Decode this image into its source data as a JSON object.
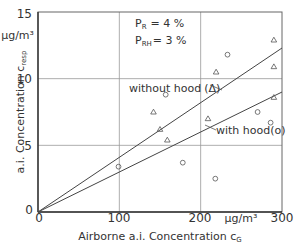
{
  "chart_data": {
    "type": "scatter",
    "title": "",
    "xlabel": "Airborne a.i. Concentration c_G",
    "xlabel_main": "Airborne a.i. Concentration c",
    "xlabel_sub": "G",
    "ylabel_main": "a.i. Concentration c",
    "ylabel_sub": "resp",
    "x_unit": "µg/m³",
    "y_unit": "µg/m³",
    "xlim": [
      0,
      300
    ],
    "ylim": [
      0,
      15
    ],
    "xticks": [
      "0",
      "100",
      "200",
      "300"
    ],
    "yticks": [
      "0",
      "5",
      "10",
      "15"
    ],
    "grid": true,
    "annotations": [
      {
        "label": "P",
        "sub": "R",
        "value": "= 4 %"
      },
      {
        "label": "P",
        "sub": "RH",
        "value": "= 3 %"
      }
    ],
    "series": [
      {
        "name": "without hood (Δ)",
        "label": "without hood",
        "marker": "triangle",
        "marker_label": "(Δ)",
        "points": [
          [
            142,
            7.5
          ],
          [
            150,
            6.2
          ],
          [
            159,
            5.4
          ],
          [
            209,
            7.0
          ],
          [
            219,
            10.5
          ],
          [
            290,
            12.9
          ],
          [
            290,
            10.9
          ],
          [
            290,
            8.6
          ]
        ],
        "fit_line": {
          "from": [
            0,
            0
          ],
          "to": [
            300,
            12.3
          ]
        }
      },
      {
        "name": "with hood (o)",
        "label": "with hood",
        "marker": "circle",
        "marker_label": "(o)",
        "points": [
          [
            99,
            3.4
          ],
          [
            157,
            8.8
          ],
          [
            178,
            3.7
          ],
          [
            218,
            2.5
          ],
          [
            233,
            11.8
          ],
          [
            270,
            7.5
          ],
          [
            286,
            6.7
          ]
        ],
        "fit_line": {
          "from": [
            0,
            0
          ],
          "to": [
            300,
            9.0
          ]
        }
      }
    ]
  }
}
